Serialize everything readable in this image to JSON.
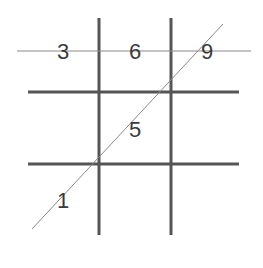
{
  "diagram": {
    "type": "tic-tac-toe grid with digits and diagonal line",
    "colors": {
      "background": "#ffffff",
      "grid_line": "#555555",
      "thin_line": "#8a8a8a",
      "digit": "#3a3a3a"
    },
    "cells": [
      {
        "label": "3",
        "row": 0,
        "col": 0
      },
      {
        "label": "6",
        "row": 0,
        "col": 1
      },
      {
        "label": "9",
        "row": 0,
        "col": 2
      },
      {
        "label": "5",
        "row": 1,
        "col": 1
      },
      {
        "label": "1",
        "row": 2,
        "col": 0
      }
    ],
    "lines": {
      "horizontal_through_top_row": "thin line through 3, 6, 9",
      "diagonal": "thin line through 1, 5, 9"
    }
  }
}
